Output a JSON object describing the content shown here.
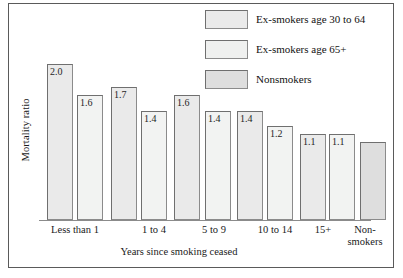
{
  "clipped_caption": "",
  "figure": {
    "frame_color": "#5a5a5a",
    "background": "#ffffff"
  },
  "legend": {
    "position": "top-right",
    "items": [
      {
        "label": "Ex-smokers age 30 to 64",
        "color": "#eaeaea"
      },
      {
        "label": "Ex-smokers age 65+",
        "color": "#eff0ef"
      },
      {
        "label": "Nonsmokers",
        "color": "#dedede"
      }
    ]
  },
  "axes": {
    "ylabel": "Mortality ratio",
    "xlabel": "Years since smoking ceased",
    "xticks": [
      "Less than 1",
      "1 to 4",
      "5 to 9",
      "10 to 14",
      "15+",
      "Non-\nsmokers"
    ],
    "xtick_nonsmokers_line1": "Non-",
    "xtick_nonsmokers_line2": "smokers"
  },
  "chart_data": {
    "type": "bar",
    "title": "",
    "subtitle": "",
    "xlabel": "Years since smoking ceased",
    "ylabel": "Mortality ratio",
    "ylim": [
      0,
      2.15
    ],
    "grid": false,
    "legend_position": "top-right",
    "categories": [
      "Less than 1",
      "1 to 4",
      "5 to 9",
      "10 to 14",
      "15+",
      "Nonsmokers"
    ],
    "series": [
      {
        "name": "Ex-smokers age 30 to 64",
        "color": "#eaeaea",
        "values": [
          2.0,
          1.7,
          1.6,
          1.4,
          1.1,
          null
        ]
      },
      {
        "name": "Ex-smokers age 65+",
        "color": "#eff0ef",
        "values": [
          1.6,
          1.4,
          1.4,
          1.2,
          1.1,
          null
        ]
      },
      {
        "name": "Nonsmokers",
        "color": "#dedede",
        "values": [
          null,
          null,
          null,
          null,
          null,
          1.0
        ]
      }
    ],
    "bars": [
      {
        "group": "Less than 1",
        "series": "Ex-smokers age 30 to 64",
        "value": 2.0,
        "label": "2.0",
        "color": "#eaeaea"
      },
      {
        "group": "Less than 1",
        "series": "Ex-smokers age 65+",
        "value": 1.6,
        "label": "1.6",
        "color": "#f2f3f2"
      },
      {
        "group": "1 to 4",
        "series": "Ex-smokers age 30 to 64",
        "value": 1.7,
        "label": "1.7",
        "color": "#eaeaea"
      },
      {
        "group": "1 to 4",
        "series": "Ex-smokers age 65+",
        "value": 1.4,
        "label": "1.4",
        "color": "#f2f3f2"
      },
      {
        "group": "5 to 9",
        "series": "Ex-smokers age 30 to 64",
        "value": 1.6,
        "label": "1.6",
        "color": "#eaeaea"
      },
      {
        "group": "5 to 9",
        "series": "Ex-smokers age 65+",
        "value": 1.4,
        "label": "1.4",
        "color": "#f2f3f2"
      },
      {
        "group": "10 to 14",
        "series": "Ex-smokers age 30 to 64",
        "value": 1.4,
        "label": "1.4",
        "color": "#eaeaea"
      },
      {
        "group": "10 to 14",
        "series": "Ex-smokers age 65+",
        "value": 1.2,
        "label": "1.2",
        "color": "#f2f3f2"
      },
      {
        "group": "15+",
        "series": "Ex-smokers age 30 to 64",
        "value": 1.1,
        "label": "1.1",
        "color": "#eaeaea"
      },
      {
        "group": "15+",
        "series": "Ex-smokers age 65+",
        "value": 1.1,
        "label": "1.1",
        "color": "#f2f3f2"
      },
      {
        "group": "Nonsmokers",
        "series": "Nonsmokers",
        "value": 1.0,
        "label": "",
        "color": "#dedede"
      }
    ]
  }
}
